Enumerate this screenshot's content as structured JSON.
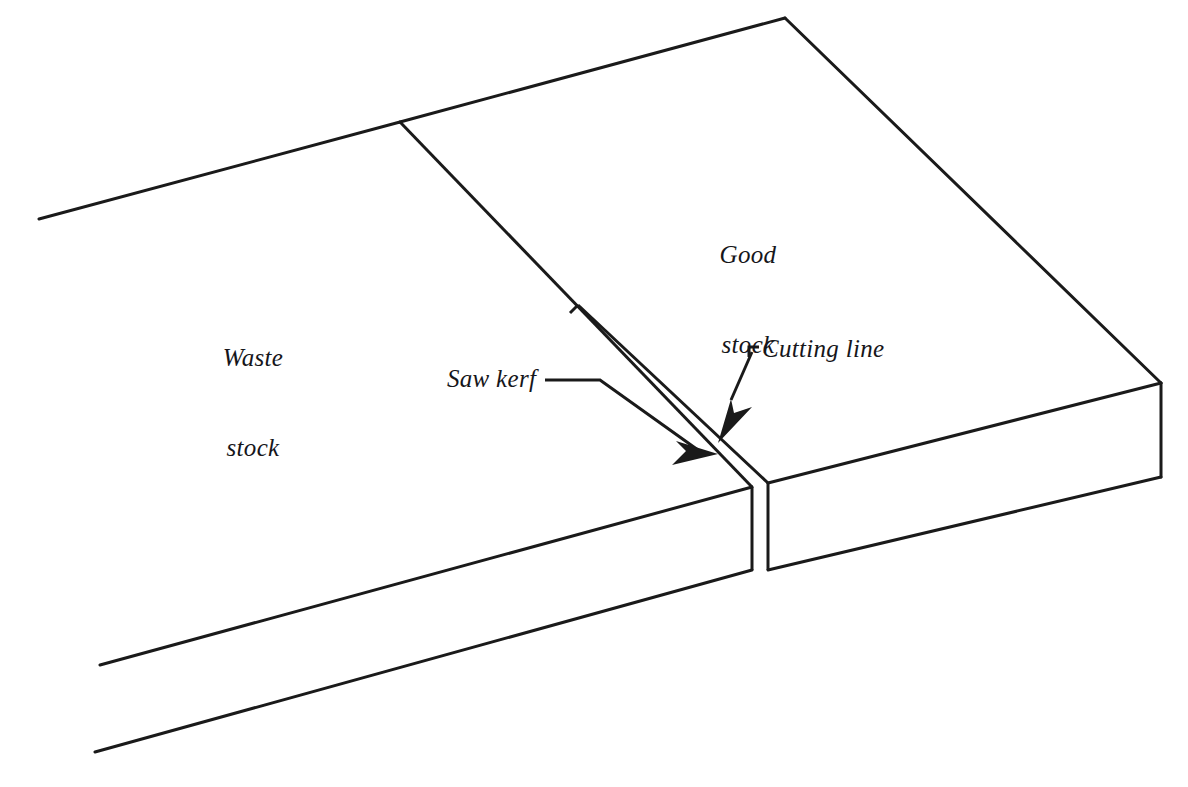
{
  "figure": {
    "background_color": "#ffffff",
    "line_color": "#1a1a1a",
    "text_color": "#16161a",
    "line_width_px": 3,
    "canvas": {
      "width": 1188,
      "height": 787
    }
  },
  "labels": {
    "waste_stock": {
      "line1": "Waste",
      "line2": "stock",
      "text": "Waste stock"
    },
    "good_stock": {
      "line1": "Good",
      "line2": "stock",
      "text": "Good stock"
    },
    "saw_kerf": {
      "text": "Saw kerf"
    },
    "cutting_line": {
      "text": "Cutting line"
    }
  },
  "geometry": {
    "board_top_face": "M 39,219 L 400,122 L 785,18 L 1161,383 L 752,483 L 570,313 Z",
    "back_edge_left": "M 39,219 L 400,122",
    "back_edge_right": "M 400,122 L 785,18",
    "right_edge_top": "M 785,18 L 1161,383",
    "front_top_edge_right": "M 1161,383 L 768,483",
    "front_top_edge_left": "M 752,487 L 100,665",
    "right_side_vertical": "M 1161,383 L 1161,477",
    "front_bottom_edge_right": "M 1161,477 L 768,570",
    "front_bottom_edge_left": "M 752,570 L 95,752",
    "kerf_vertical_right": "M 768,483 L 768,570",
    "kerf_vertical_left": "M 752,487 L 752,570",
    "cutting_line": "M 400,122 L 752,487",
    "kerf_slot_left": "M 570,313 L 752,487",
    "kerf_slot_right": "M 578,305 L 768,483",
    "kerf_slot_cap": "M 570,313 L 578,305"
  },
  "annotations": {
    "saw_kerf_leader": "M 545,380 L 600,380 L 700,452",
    "saw_kerf_arrow_tip": {
      "x": 716,
      "y": 453
    },
    "cutting_line_leader": "M 757,347 L 749,347 L 749,356 L 749,347 L 734,382 L 724,428",
    "cutting_line_arrow_tip": {
      "x": 720,
      "y": 444
    }
  }
}
